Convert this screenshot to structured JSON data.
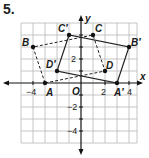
{
  "problem_number": "5.",
  "axes": {
    "x_label": "x",
    "y_label": "y",
    "origin_label": "O"
  },
  "tick_labels": {
    "x": [
      "−4",
      "2",
      "4"
    ],
    "y": [
      "2",
      "−2",
      "−4"
    ]
  },
  "grid": {
    "xmin": -5,
    "xmax": 4.6,
    "ymin": -5,
    "ymax": 5,
    "unit_px": 12,
    "origin_px": [
      81,
      83
    ]
  },
  "figures": {
    "original": {
      "style": "dashed",
      "vertices": [
        {
          "name": "A",
          "x": -3,
          "y": 0
        },
        {
          "name": "B",
          "x": -4,
          "y": 3
        },
        {
          "name": "C",
          "x": 1,
          "y": 4
        },
        {
          "name": "D",
          "x": 2,
          "y": 1
        }
      ]
    },
    "image": {
      "style": "solid",
      "vertices": [
        {
          "name": "A'",
          "x": 3,
          "y": 0
        },
        {
          "name": "B'",
          "x": 4,
          "y": 3
        },
        {
          "name": "C'",
          "x": -1,
          "y": 4
        },
        {
          "name": "D'",
          "x": -2,
          "y": 1
        }
      ]
    }
  },
  "labels": {
    "A": "A",
    "B": "B",
    "C": "C",
    "D": "D",
    "A_prime": "A′",
    "B_prime": "B′",
    "C_prime": "C′",
    "D_prime": "D′"
  }
}
